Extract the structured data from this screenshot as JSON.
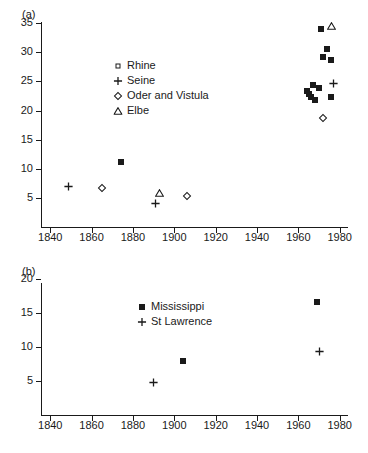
{
  "figure": {
    "background": "#ffffff",
    "ink": "#1a1a1a"
  },
  "chart_data": [
    {
      "type": "scatter",
      "panel": "(a)",
      "title": "",
      "xlabel": "",
      "ylabel": "",
      "xlim": [
        1836,
        1984
      ],
      "ylim": [
        0,
        39
      ],
      "xticks": [
        1840,
        1860,
        1880,
        1900,
        1920,
        1940,
        1960,
        1980
      ],
      "yticks": [
        5,
        10,
        15,
        20,
        25,
        30,
        35
      ],
      "grid": false,
      "legend_position": "upper-center-left",
      "series": [
        {
          "name": "Rhine",
          "marker": "filled-square",
          "legend_marker": "open-square",
          "points": [
            {
              "x": 1874,
              "y": 11.1
            },
            {
              "x": 1964,
              "y": 23.3
            },
            {
              "x": 1965,
              "y": 22.9
            },
            {
              "x": 1966,
              "y": 22.3
            },
            {
              "x": 1967,
              "y": 24.4
            },
            {
              "x": 1968,
              "y": 21.8
            },
            {
              "x": 1970,
              "y": 23.8
            },
            {
              "x": 1971,
              "y": 34.1
            },
            {
              "x": 1972,
              "y": 29.2
            },
            {
              "x": 1974,
              "y": 30.6
            },
            {
              "x": 1976,
              "y": 28.7
            },
            {
              "x": 1976,
              "y": 22.4
            }
          ]
        },
        {
          "name": "Seine",
          "marker": "plus",
          "legend_marker": "plus",
          "points": [
            {
              "x": 1849,
              "y": 6.9
            },
            {
              "x": 1891,
              "y": 4.1
            },
            {
              "x": 1977,
              "y": 24.7
            }
          ]
        },
        {
          "name": "Oder and Vistula",
          "marker": "open-diamond",
          "legend_marker": "open-diamond",
          "points": [
            {
              "x": 1865,
              "y": 6.7
            },
            {
              "x": 1906,
              "y": 5.4
            },
            {
              "x": 1972,
              "y": 18.7
            }
          ]
        },
        {
          "name": "Elbe",
          "marker": "open-triangle",
          "legend_marker": "open-triangle",
          "points": [
            {
              "x": 1893,
              "y": 5.9
            },
            {
              "x": 1976,
              "y": 34.5
            }
          ]
        }
      ]
    },
    {
      "type": "scatter",
      "panel": "(b)",
      "title": "",
      "xlabel": "",
      "ylabel": "",
      "xlim": [
        1836,
        1984
      ],
      "ylim": [
        0,
        23.5
      ],
      "xticks": [
        1840,
        1860,
        1880,
        1900,
        1920,
        1940,
        1960,
        1980
      ],
      "yticks": [
        5,
        10,
        15,
        20
      ],
      "grid": false,
      "legend_position": "upper-center",
      "series": [
        {
          "name": "Mississippi",
          "marker": "filled-square",
          "legend_marker": "filled-square",
          "points": [
            {
              "x": 1904,
              "y": 8.0
            },
            {
              "x": 1969,
              "y": 16.6
            }
          ]
        },
        {
          "name": "St Lawrence",
          "marker": "plus",
          "legend_marker": "plus",
          "points": [
            {
              "x": 1890,
              "y": 4.8
            },
            {
              "x": 1970,
              "y": 9.4
            }
          ]
        }
      ]
    }
  ],
  "panel_a": {
    "label": "(a)",
    "legend": [
      {
        "label": "Rhine",
        "symbol": "open-square"
      },
      {
        "label": "Seine",
        "symbol": "plus"
      },
      {
        "label": "Oder and Vistula",
        "symbol": "open-diamond"
      },
      {
        "label": "Elbe",
        "symbol": "open-triangle"
      }
    ],
    "yticklabels": [
      "35",
      "30",
      "25",
      "20",
      "15",
      "10",
      "5"
    ],
    "xticklabels": [
      "1840",
      "1860",
      "1880",
      "1900",
      "1920",
      "1940",
      "1960",
      "1980"
    ]
  },
  "panel_b": {
    "label": "(b)",
    "legend": [
      {
        "label": "Mississippi",
        "symbol": "filled-square"
      },
      {
        "label": "St Lawrence",
        "symbol": "plus"
      }
    ],
    "yticklabels": [
      "20",
      "15",
      "10",
      "5"
    ],
    "xticklabels": [
      "1840",
      "1860",
      "1880",
      "1900",
      "1920",
      "1940",
      "1960",
      "1980"
    ]
  }
}
